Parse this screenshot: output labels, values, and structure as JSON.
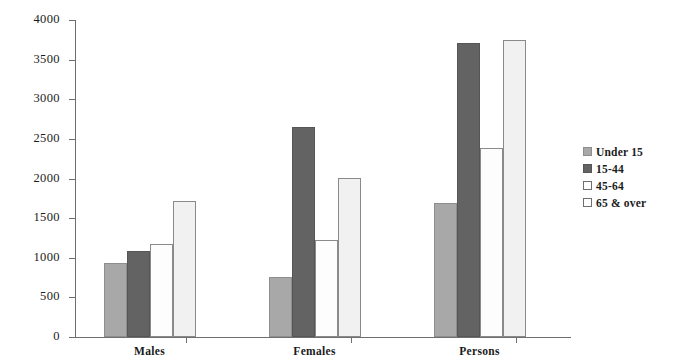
{
  "chart_data": {
    "type": "bar",
    "title": "",
    "subtitle": "",
    "xlabel": "",
    "ylabel": "",
    "categories": [
      "Males",
      "Females",
      "Persons"
    ],
    "series": [
      {
        "name": "Under 15",
        "values": [
          930,
          760,
          1690
        ]
      },
      {
        "name": "15-44",
        "values": [
          1080,
          2650,
          3710
        ]
      },
      {
        "name": "45-64",
        "values": [
          1170,
          1220,
          2380
        ]
      },
      {
        "name": "65 & over",
        "values": [
          1720,
          2010,
          3750
        ]
      }
    ],
    "ylim": [
      0,
      4000
    ],
    "yticks": [
      0,
      500,
      1000,
      1500,
      2000,
      2500,
      3000,
      3500,
      4000
    ],
    "ytick_labels": [
      "0",
      "500",
      "1000",
      "1500",
      "2000",
      "2500",
      "3000",
      "3500",
      "4000"
    ],
    "grid": false,
    "legend_position": "right",
    "colors": [
      "#a8a8a8",
      "#636363",
      "#fdfdfd",
      "#f1f1f1"
    ]
  },
  "legend": {
    "items": [
      {
        "label": "Under 15"
      },
      {
        "label": "15-44"
      },
      {
        "label": "45-64"
      },
      {
        "label": "65 & over"
      }
    ]
  }
}
